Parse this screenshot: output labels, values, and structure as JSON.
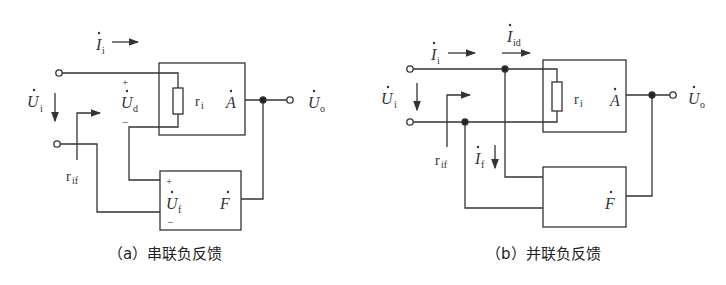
{
  "diagrams": [
    {
      "id": "a",
      "caption": "（a）串联负反馈",
      "labels": {
        "input_current": "I",
        "input_current_sub": "i",
        "input_voltage": "U",
        "input_voltage_sub": "i",
        "diff_voltage": "U",
        "diff_voltage_sub": "d",
        "feedback_voltage": "U",
        "feedback_voltage_sub": "f",
        "input_resistance": "r",
        "input_resistance_sub": "i",
        "closed_loop_input_resistance": "r",
        "closed_loop_input_resistance_sub": "if",
        "amplifier": "A",
        "feedback_network": "F",
        "output_voltage": "U",
        "output_voltage_sub": "o",
        "plus": "+",
        "minus": "−"
      }
    },
    {
      "id": "b",
      "caption": "（b）并联负反馈",
      "labels": {
        "input_current": "I",
        "input_current_sub": "i",
        "diff_current": "I",
        "diff_current_sub": "id",
        "feedback_current": "I",
        "feedback_current_sub": "f",
        "input_voltage": "U",
        "input_voltage_sub": "i",
        "input_resistance": "r",
        "input_resistance_sub": "i",
        "closed_loop_input_resistance": "r",
        "closed_loop_input_resistance_sub": "if",
        "amplifier": "A",
        "feedback_network": "F",
        "output_voltage": "U",
        "output_voltage_sub": "o"
      }
    }
  ],
  "colors": {
    "line": "#333333",
    "background": "#ffffff"
  }
}
